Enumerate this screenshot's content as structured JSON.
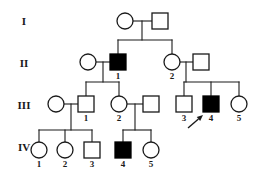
{
  "figure": {
    "kind": "pedigree-chart",
    "width": 260,
    "height": 183,
    "background_color": "#ffffff",
    "line_color": "#1a1a1a",
    "affected_fill": "#000000",
    "unaffected_fill": "#ffffff"
  },
  "legend_semantics": {
    "circle": "female",
    "square": "male",
    "filled": "affected",
    "open": "unaffected",
    "arrow": "proband"
  },
  "generation_labels": [
    {
      "name": "generation-label-1",
      "text": "I",
      "x": 24,
      "y": 22
    },
    {
      "name": "generation-label-2",
      "text": "II",
      "x": 24,
      "y": 64
    },
    {
      "name": "generation-label-3",
      "text": "III",
      "x": 24,
      "y": 106
    },
    {
      "name": "generation-label-4",
      "text": "IV",
      "x": 24,
      "y": 148
    }
  ],
  "individuals": [
    {
      "id": "I-1",
      "generation": "I",
      "number": "",
      "sex": "female",
      "shape": "circle",
      "affected": false,
      "x": 125,
      "y": 21,
      "r": 8,
      "label": ""
    },
    {
      "id": "I-2",
      "generation": "I",
      "number": "",
      "sex": "male",
      "shape": "square",
      "affected": false,
      "x": 160,
      "y": 21,
      "r": 8,
      "label": ""
    },
    {
      "id": "II-1m",
      "generation": "II",
      "number": "",
      "sex": "female",
      "shape": "circle",
      "affected": false,
      "x": 88,
      "y": 62,
      "r": 8,
      "label": ""
    },
    {
      "id": "II-1",
      "generation": "II",
      "number": "1",
      "sex": "male",
      "shape": "square",
      "affected": true,
      "x": 118,
      "y": 62,
      "r": 8,
      "label": "1"
    },
    {
      "id": "II-2",
      "generation": "II",
      "number": "2",
      "sex": "female",
      "shape": "circle",
      "affected": false,
      "x": 172,
      "y": 62,
      "r": 8,
      "label": "2"
    },
    {
      "id": "II-2m",
      "generation": "II",
      "number": "",
      "sex": "male",
      "shape": "square",
      "affected": false,
      "x": 201,
      "y": 62,
      "r": 8,
      "label": ""
    },
    {
      "id": "III-1m",
      "generation": "III",
      "number": "",
      "sex": "female",
      "shape": "circle",
      "affected": false,
      "x": 56,
      "y": 104,
      "r": 8,
      "label": ""
    },
    {
      "id": "III-1",
      "generation": "III",
      "number": "1",
      "sex": "male",
      "shape": "square",
      "affected": false,
      "x": 86,
      "y": 104,
      "r": 8,
      "label": "1"
    },
    {
      "id": "III-2",
      "generation": "III",
      "number": "2",
      "sex": "female",
      "shape": "circle",
      "affected": false,
      "x": 119,
      "y": 104,
      "r": 8,
      "label": "2"
    },
    {
      "id": "III-2m",
      "generation": "III",
      "number": "",
      "sex": "male",
      "shape": "square",
      "affected": false,
      "x": 151,
      "y": 104,
      "r": 8,
      "label": ""
    },
    {
      "id": "III-3",
      "generation": "III",
      "number": "3",
      "sex": "male",
      "shape": "square",
      "affected": false,
      "x": 184,
      "y": 104,
      "r": 8,
      "label": "3"
    },
    {
      "id": "III-4",
      "generation": "III",
      "number": "4",
      "sex": "male",
      "shape": "square",
      "affected": true,
      "x": 211,
      "y": 104,
      "r": 8,
      "label": "4",
      "proband": true
    },
    {
      "id": "III-5",
      "generation": "III",
      "number": "5",
      "sex": "female",
      "shape": "circle",
      "affected": false,
      "x": 239,
      "y": 104,
      "r": 8,
      "label": "5"
    },
    {
      "id": "IV-1",
      "generation": "IV",
      "number": "1",
      "sex": "female",
      "shape": "circle",
      "affected": false,
      "x": 39,
      "y": 150,
      "r": 8,
      "label": "1"
    },
    {
      "id": "IV-2",
      "generation": "IV",
      "number": "2",
      "sex": "female",
      "shape": "circle",
      "affected": false,
      "x": 65,
      "y": 150,
      "r": 8,
      "label": "2"
    },
    {
      "id": "IV-3",
      "generation": "IV",
      "number": "3",
      "sex": "male",
      "shape": "square",
      "affected": false,
      "x": 92,
      "y": 150,
      "r": 8,
      "label": "3"
    },
    {
      "id": "IV-4",
      "generation": "IV",
      "number": "4",
      "sex": "male",
      "shape": "square",
      "affected": true,
      "x": 123,
      "y": 150,
      "r": 8,
      "label": "4"
    },
    {
      "id": "IV-5",
      "generation": "IV",
      "number": "5",
      "sex": "female",
      "shape": "circle",
      "affected": false,
      "x": 151,
      "y": 150,
      "r": 8,
      "label": "5"
    }
  ],
  "proband_arrow": {
    "name": "proband-arrow",
    "points_to": "III-4",
    "tail_x": 188,
    "tail_y": 128,
    "tip_x": 203,
    "tip_y": 115
  },
  "connections": {
    "matings": [
      {
        "name": "mating-I",
        "x1": 133,
        "x2": 152,
        "y": 21
      },
      {
        "name": "mating-II-1",
        "x1": 96,
        "x2": 110,
        "y": 62
      },
      {
        "name": "mating-II-2",
        "x1": 180,
        "x2": 193,
        "y": 62
      },
      {
        "name": "mating-III-1",
        "x1": 64,
        "x2": 78,
        "y": 104
      },
      {
        "name": "mating-III-2",
        "x1": 127,
        "x2": 143,
        "y": 104
      }
    ],
    "sibships": [
      {
        "name": "sibship-I-to-II",
        "drop_x": 142,
        "drop_y1": 21,
        "drop_y2": 40,
        "bar_y": 40,
        "bar_x1": 118,
        "bar_x2": 172,
        "children_x": [
          118,
          172
        ],
        "child_y": 54
      },
      {
        "name": "sibship-II1-to-III",
        "drop_x": 103,
        "drop_y1": 62,
        "drop_y2": 82,
        "bar_y": 82,
        "bar_x1": 86,
        "bar_x2": 119,
        "children_x": [
          86,
          119
        ],
        "child_y": 96
      },
      {
        "name": "sibship-II2-to-III",
        "drop_x": 186,
        "drop_y1": 62,
        "drop_y2": 82,
        "bar_y": 82,
        "bar_x1": 184,
        "bar_x2": 239,
        "children_x": [
          184,
          211,
          239
        ],
        "child_y": 96
      },
      {
        "name": "sibship-III1-to-IV",
        "drop_x": 71,
        "drop_y1": 104,
        "drop_y2": 130,
        "bar_y": 130,
        "bar_x1": 39,
        "bar_x2": 92,
        "children_x": [
          39,
          65,
          92
        ],
        "child_y": 142
      },
      {
        "name": "sibship-III2-to-IV",
        "drop_x": 135,
        "drop_y1": 104,
        "drop_y2": 130,
        "bar_y": 130,
        "bar_x1": 123,
        "bar_x2": 151,
        "children_x": [
          123,
          151
        ],
        "child_y": 142
      }
    ]
  }
}
